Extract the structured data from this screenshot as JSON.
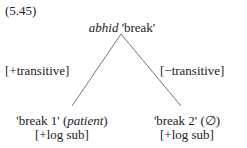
{
  "example_number": "(5.45)",
  "root": {
    "form": "abhid",
    "gloss": "'break'"
  },
  "branches": [
    {
      "feature": "[+transitive]",
      "node_gloss": "'break 1'",
      "node_arg": "patient",
      "node_feature": "[+log sub]"
    },
    {
      "feature": "[−transitive]",
      "node_gloss": "'break 2'",
      "node_arg": "(∅)",
      "node_feature": "[+log sub]"
    }
  ]
}
